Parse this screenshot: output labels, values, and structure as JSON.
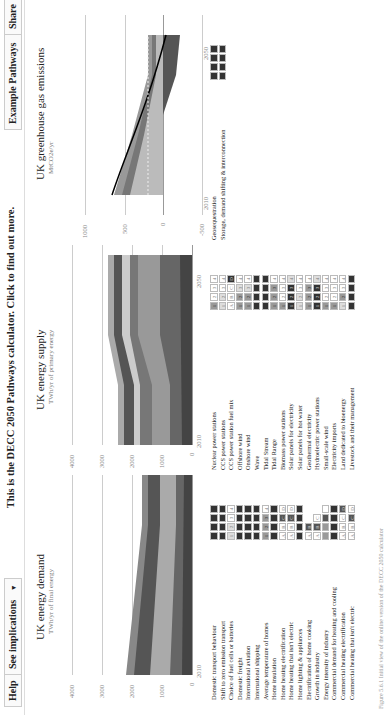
{
  "topbar": {
    "help_label": "Help",
    "implications_label": "See implications",
    "implications_arrow": "▼",
    "title": "This is the DECC 2050 Pathways calculator. Click to find out more.",
    "example_label": "Example Pathways",
    "example_arrow": "▼",
    "share_label": "Share"
  },
  "charts": {
    "demand": {
      "title": "UK energy demand",
      "subtitle": "TWh/yr of final energy",
      "yticks": [
        "4000",
        "3000",
        "2000",
        "1000",
        "0"
      ],
      "xticks": [
        "2010",
        "2050"
      ]
    },
    "supply": {
      "title": "UK energy supply",
      "subtitle": "TWh/yr of primary energy",
      "yticks": [
        "4000",
        "3000",
        "2000",
        "1000",
        "0"
      ],
      "xticks": [
        "2010",
        "2050"
      ]
    },
    "emissions": {
      "title": "UK greenhouse gas emissions",
      "subtitle": "MtCO2e/yr",
      "yticks": [
        "1000",
        "500",
        "0",
        "-500"
      ],
      "xticks": [
        "2010",
        "2050"
      ]
    }
  },
  "chart_data": [
    {
      "type": "area",
      "title": "UK energy demand",
      "ylabel": "TWh/yr of final energy",
      "x": [
        2010,
        2050
      ],
      "ylim": [
        0,
        4000
      ],
      "series": [
        {
          "name": "total",
          "values": [
            2200,
            1500
          ]
        }
      ]
    },
    {
      "type": "area",
      "title": "UK energy supply",
      "ylabel": "TWh/yr of primary energy",
      "x": [
        2010,
        2050
      ],
      "ylim": [
        0,
        4000
      ],
      "series": [
        {
          "name": "total",
          "values": [
            2500,
            2400
          ]
        }
      ]
    },
    {
      "type": "area",
      "title": "UK greenhouse gas emissions",
      "ylabel": "MtCO2e/yr",
      "x": [
        2010,
        2050
      ],
      "ylim": [
        -500,
        1000
      ],
      "series": [
        {
          "name": "net emissions",
          "values": [
            650,
            0
          ]
        }
      ]
    }
  ],
  "levers_demand": [
    {
      "label": "Domestic transport behaviour",
      "boxes": [
        "",
        "",
        "",
        ""
      ],
      "level": [
        4,
        4,
        4,
        4
      ]
    },
    {
      "label": "Shift to zero emission transport",
      "boxes": [
        "",
        "",
        "",
        ""
      ],
      "level": [
        4,
        4,
        4,
        4
      ]
    },
    {
      "label": "Choice of fuel cells or batteries",
      "boxes": [
        "1",
        "2",
        "3",
        "4"
      ],
      "level": [
        1,
        1,
        0,
        0
      ]
    },
    {
      "label": "Domestic freight",
      "boxes": [
        "",
        "",
        "",
        ""
      ],
      "level": [
        4,
        4,
        4,
        4
      ]
    },
    {
      "label": "International aviation",
      "boxes": [
        "",
        "",
        "",
        ""
      ],
      "level": [
        4,
        4,
        4,
        4
      ]
    },
    {
      "label": "International shipping",
      "boxes": [
        "",
        "",
        "",
        ""
      ],
      "level": [
        4,
        4,
        4,
        4
      ]
    },
    {
      "label": "Average temperature of homes",
      "boxes": [
        "1",
        "2",
        "3",
        "4"
      ],
      "level": [
        2,
        2,
        2,
        0
      ]
    },
    {
      "label": "Home insulation",
      "boxes": [
        "",
        "",
        "",
        ""
      ],
      "level": [
        4,
        4,
        4,
        4
      ]
    },
    {
      "label": "Home heating electrification",
      "boxes": [
        "A",
        "B",
        "C",
        "D"
      ],
      "level": [
        0,
        0,
        3,
        0
      ]
    },
    {
      "label": "Home heating that isn't electric",
      "boxes": [
        "A",
        "B",
        "C",
        "D"
      ],
      "level": [
        0,
        0,
        3,
        0
      ]
    },
    {
      "label": "Home lighting & appliances",
      "boxes": [
        "",
        "",
        "",
        ""
      ],
      "level": [
        4,
        4,
        4,
        4
      ]
    },
    {
      "label": "Electrification of home cooking",
      "boxes": [
        "A",
        "B"
      ],
      "level": [
        0,
        3
      ]
    },
    {
      "label": "Growth in industry",
      "boxes": [
        "A",
        "B",
        "C"
      ],
      "level": [
        0,
        3,
        0
      ]
    },
    {
      "label": "Energy intensity of industry",
      "boxes": [
        "",
        "",
        "",
        ""
      ],
      "level": [
        2,
        2,
        3,
        0
      ]
    },
    {
      "label": "Commercial demand for heating and cooling",
      "boxes": [
        "",
        "",
        "",
        ""
      ],
      "level": [
        4,
        4,
        4,
        4
      ]
    },
    {
      "label": "Commercial heating electrification",
      "boxes": [
        "A",
        "B",
        "C",
        "D"
      ],
      "level": [
        0,
        0,
        0,
        3
      ]
    },
    {
      "label": "Commercial heating that isn't electric",
      "boxes": [
        "A",
        "B",
        "C",
        "D"
      ],
      "level": [
        0,
        0,
        3,
        0
      ]
    }
  ],
  "levers_supply": [
    {
      "label": "Nuclear power stations",
      "boxes": [
        "1",
        "2",
        "3",
        "4"
      ],
      "level": [
        2,
        0,
        0,
        0
      ]
    },
    {
      "label": "CCS power stations",
      "boxes": [
        "1",
        "2",
        "3",
        "4"
      ],
      "level": [
        1,
        1,
        0,
        0
      ]
    },
    {
      "label": "CCS power station fuel mix",
      "boxes": [
        "A",
        "B",
        "C",
        "D"
      ],
      "level": [
        0,
        0,
        0,
        4
      ]
    },
    {
      "label": "Offshore wind",
      "boxes": [
        "1",
        "2",
        "3",
        "4"
      ],
      "level": [
        2,
        2,
        1,
        0
      ]
    },
    {
      "label": "Onshore wind",
      "boxes": [
        "1",
        "2",
        "3",
        "4"
      ],
      "level": [
        2,
        2,
        1,
        0
      ]
    },
    {
      "label": "Wave",
      "boxes": [
        "",
        "",
        "",
        ""
      ],
      "level": [
        4,
        4,
        4,
        4
      ]
    },
    {
      "label": "Tidal Stream",
      "boxes": [
        "",
        "",
        "",
        ""
      ],
      "level": [
        4,
        4,
        4,
        4
      ]
    },
    {
      "label": "Tidal Range",
      "boxes": [
        "1",
        "2",
        "3",
        "4"
      ],
      "level": [
        2,
        2,
        2,
        0
      ]
    },
    {
      "label": "Biomass power stations",
      "boxes": [
        "1",
        "2",
        "3",
        "4"
      ],
      "level": [
        2,
        0,
        0,
        0
      ]
    },
    {
      "label": "Solar panels for electricity",
      "boxes": [
        "1",
        "2",
        "3",
        "4"
      ],
      "level": [
        4,
        4,
        4,
        1
      ]
    },
    {
      "label": "Solar panels for hot water",
      "boxes": [
        "1",
        "2",
        "3",
        "4"
      ],
      "level": [
        1,
        1,
        0,
        0
      ]
    },
    {
      "label": "Geothermal electricity",
      "boxes": [
        "1",
        "2",
        "3",
        "4"
      ],
      "level": [
        2,
        2,
        2,
        0
      ]
    },
    {
      "label": "Hydroelectric power stations",
      "boxes": [
        "1",
        "2",
        "3",
        "4"
      ],
      "level": [
        4,
        4,
        4,
        1
      ]
    },
    {
      "label": "Small-scale wind",
      "boxes": [
        "1",
        "2",
        "3",
        "4"
      ],
      "level": [
        2,
        0,
        0,
        0
      ]
    },
    {
      "label": "Electricity imports",
      "boxes": [
        "1",
        "2",
        "3",
        "4"
      ],
      "level": [
        2,
        0,
        0,
        0
      ]
    },
    {
      "label": "Land dedicated to bioenergy",
      "boxes": [
        "1",
        "2",
        "3",
        "4"
      ],
      "level": [
        1,
        2,
        0,
        0
      ]
    },
    {
      "label": "Livestock and their management",
      "boxes": [
        "",
        "",
        "",
        ""
      ],
      "level": [
        4,
        4,
        4,
        4
      ]
    }
  ],
  "levers_other": [
    {
      "label": "Geosequestration",
      "boxes": [
        "",
        "",
        "",
        ""
      ],
      "level": [
        4,
        4,
        4,
        4
      ]
    },
    {
      "label": "Storage, demand shifting & interconnection",
      "boxes": [
        "",
        "",
        "",
        ""
      ],
      "level": [
        4,
        4,
        4,
        4
      ]
    }
  ],
  "caption": "Figure 5.6.1 Initial view of the online version of the DECC 2050 calculator"
}
